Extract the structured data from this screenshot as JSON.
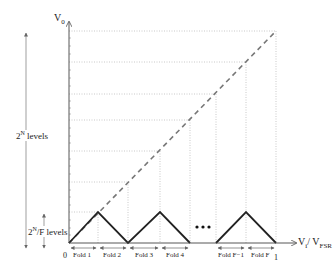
{
  "diagram": {
    "type": "folding-adc-transfer-characteristic",
    "y_axis": {
      "label": "V",
      "label_sub": "0"
    },
    "x_axis": {
      "label_main": "V",
      "label_main_sub": "i",
      "label_div": "/ V",
      "label_div_sub": "FSR",
      "tick_start": "0",
      "tick_end": "1"
    },
    "left_annotations": {
      "total_levels": {
        "base": "2",
        "exp": "N",
        "suffix": " levels"
      },
      "fold_levels": {
        "base": "2",
        "exp": "N",
        "suffix": "/F levels"
      }
    },
    "folds": [
      {
        "label": "Fold 1"
      },
      {
        "label": "Fold 2"
      },
      {
        "label": "Fold 3"
      },
      {
        "label": "Fold 4"
      },
      {
        "label": "Fold F−1"
      },
      {
        "label": "Fold F"
      }
    ],
    "ellipsis": "•••",
    "colors": {
      "fold_line": "#222222",
      "ideal_dashed": "#777777",
      "grid_dotted": "#bbbbbb",
      "axes": "#444444"
    }
  }
}
